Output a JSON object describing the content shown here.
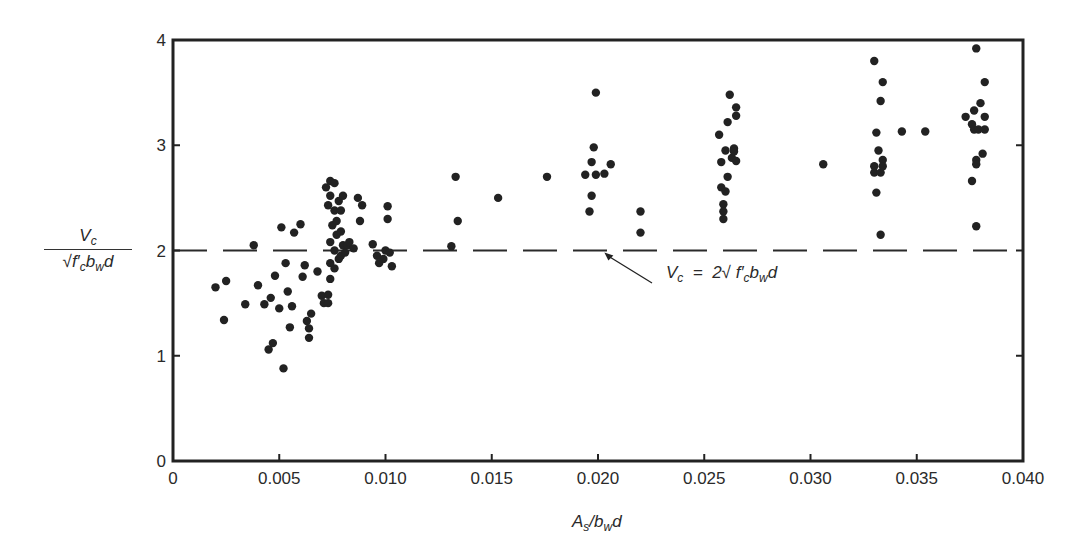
{
  "chart_data": {
    "type": "scatter",
    "title": "",
    "xlabel": "As/bwd",
    "ylabel": "Vc / (sqrt(f'c) bw d)",
    "xlim": [
      0,
      0.04
    ],
    "ylim": [
      0,
      4
    ],
    "x_ticks": [
      "0",
      "0.005",
      "0.010",
      "0.015",
      "0.020",
      "0.025",
      "0.030",
      "0.035",
      "0.040"
    ],
    "y_ticks": [
      "0",
      "1",
      "2",
      "3",
      "4"
    ],
    "grid": false,
    "legend": null,
    "reference_line": {
      "y": 2.0,
      "style": "dashed",
      "label": "Vc = 2 sqrt(f'c) bw d"
    },
    "annotation": {
      "text": "Vc = 2√f′c bw d",
      "arrow_to": [
        0.0203,
        2.0
      ]
    },
    "series": [
      {
        "name": "test data",
        "points": [
          [
            0.002,
            1.65
          ],
          [
            0.0025,
            1.71
          ],
          [
            0.0024,
            1.34
          ],
          [
            0.0034,
            1.49
          ],
          [
            0.0038,
            2.05
          ],
          [
            0.004,
            1.67
          ],
          [
            0.0043,
            1.49
          ],
          [
            0.0045,
            1.06
          ],
          [
            0.0046,
            1.55
          ],
          [
            0.0047,
            1.12
          ],
          [
            0.0048,
            1.76
          ],
          [
            0.005,
            1.45
          ],
          [
            0.0051,
            2.22
          ],
          [
            0.0052,
            0.88
          ],
          [
            0.0053,
            1.88
          ],
          [
            0.0054,
            1.61
          ],
          [
            0.0055,
            1.27
          ],
          [
            0.0056,
            1.47
          ],
          [
            0.0057,
            2.17
          ],
          [
            0.006,
            2.25
          ],
          [
            0.0061,
            1.75
          ],
          [
            0.0062,
            1.86
          ],
          [
            0.0063,
            1.33
          ],
          [
            0.0064,
            1.26
          ],
          [
            0.0064,
            1.17
          ],
          [
            0.0065,
            1.4
          ],
          [
            0.0068,
            1.8
          ],
          [
            0.007,
            1.57
          ],
          [
            0.0071,
            1.5
          ],
          [
            0.0073,
            1.5
          ],
          [
            0.0073,
            1.58
          ],
          [
            0.0074,
            1.73
          ],
          [
            0.0072,
            2.6
          ],
          [
            0.0074,
            2.66
          ],
          [
            0.0076,
            2.64
          ],
          [
            0.0073,
            2.43
          ],
          [
            0.0074,
            2.52
          ],
          [
            0.0076,
            2.38
          ],
          [
            0.0078,
            2.47
          ],
          [
            0.008,
            2.52
          ],
          [
            0.0079,
            2.38
          ],
          [
            0.0075,
            2.24
          ],
          [
            0.0077,
            2.15
          ],
          [
            0.0074,
            2.08
          ],
          [
            0.0076,
            2.0
          ],
          [
            0.0078,
            1.92
          ],
          [
            0.008,
            2.05
          ],
          [
            0.0082,
            2.05
          ],
          [
            0.0074,
            1.88
          ],
          [
            0.0076,
            1.83
          ],
          [
            0.0079,
            1.95
          ],
          [
            0.0081,
            1.98
          ],
          [
            0.0077,
            2.28
          ],
          [
            0.0079,
            2.18
          ],
          [
            0.0083,
            2.08
          ],
          [
            0.0085,
            2.02
          ],
          [
            0.0087,
            2.5
          ],
          [
            0.0089,
            2.43
          ],
          [
            0.0088,
            2.28
          ],
          [
            0.0094,
            2.06
          ],
          [
            0.0096,
            1.95
          ],
          [
            0.0097,
            1.88
          ],
          [
            0.0099,
            1.92
          ],
          [
            0.01,
            2.0
          ],
          [
            0.0101,
            2.42
          ],
          [
            0.0101,
            2.3
          ],
          [
            0.0102,
            1.98
          ],
          [
            0.0103,
            1.85
          ],
          [
            0.0131,
            2.04
          ],
          [
            0.0133,
            2.7
          ],
          [
            0.0134,
            2.28
          ],
          [
            0.0153,
            2.5
          ],
          [
            0.0176,
            2.7
          ],
          [
            0.0194,
            2.72
          ],
          [
            0.0196,
            2.37
          ],
          [
            0.0197,
            2.52
          ],
          [
            0.0197,
            2.84
          ],
          [
            0.0198,
            2.98
          ],
          [
            0.0199,
            3.5
          ],
          [
            0.0199,
            2.72
          ],
          [
            0.0203,
            2.73
          ],
          [
            0.0206,
            2.82
          ],
          [
            0.022,
            2.37
          ],
          [
            0.022,
            2.17
          ],
          [
            0.0257,
            3.1
          ],
          [
            0.0258,
            2.84
          ],
          [
            0.0258,
            2.6
          ],
          [
            0.0259,
            2.3
          ],
          [
            0.0259,
            2.44
          ],
          [
            0.0259,
            2.37
          ],
          [
            0.026,
            2.95
          ],
          [
            0.026,
            2.56
          ],
          [
            0.0261,
            3.22
          ],
          [
            0.0261,
            2.7
          ],
          [
            0.0262,
            3.48
          ],
          [
            0.0263,
            2.88
          ],
          [
            0.0264,
            2.97
          ],
          [
            0.0264,
            2.94
          ],
          [
            0.0265,
            3.36
          ],
          [
            0.0265,
            3.28
          ],
          [
            0.0265,
            2.85
          ],
          [
            0.0306,
            2.82
          ],
          [
            0.033,
            3.8
          ],
          [
            0.033,
            2.74
          ],
          [
            0.033,
            2.8
          ],
          [
            0.0331,
            2.55
          ],
          [
            0.0331,
            3.12
          ],
          [
            0.0332,
            2.95
          ],
          [
            0.0333,
            3.42
          ],
          [
            0.0333,
            2.74
          ],
          [
            0.0334,
            2.86
          ],
          [
            0.0334,
            3.6
          ],
          [
            0.0334,
            2.8
          ],
          [
            0.0333,
            2.15
          ],
          [
            0.0343,
            3.13
          ],
          [
            0.0354,
            3.13
          ],
          [
            0.0373,
            3.27
          ],
          [
            0.0376,
            3.2
          ],
          [
            0.0376,
            2.66
          ],
          [
            0.0377,
            3.33
          ],
          [
            0.0377,
            3.15
          ],
          [
            0.0378,
            2.86
          ],
          [
            0.0378,
            3.92
          ],
          [
            0.0378,
            2.23
          ],
          [
            0.0379,
            3.15
          ],
          [
            0.038,
            3.4
          ],
          [
            0.0381,
            2.92
          ],
          [
            0.0382,
            3.6
          ],
          [
            0.0382,
            3.27
          ],
          [
            0.0382,
            3.15
          ],
          [
            0.0378,
            2.82
          ]
        ]
      }
    ]
  },
  "labels": {
    "y_axis_numerator": "V",
    "y_axis_numerator_sub": "c",
    "y_axis_denominator": "√f′",
    "y_axis_denominator_sub1": "c",
    "y_axis_denominator_mid": "b",
    "y_axis_denominator_sub2": "w",
    "y_axis_denominator_end": "d",
    "x_axis_main": "A",
    "x_axis_sub1": "s",
    "x_axis_mid": "/b",
    "x_axis_sub2": "w",
    "x_axis_end": "d",
    "annot_v": "V",
    "annot_c": "c",
    "annot_eq": "  =  2√ f′",
    "annot_c2": "c",
    "annot_b": "b",
    "annot_w": "w",
    "annot_d": "d"
  },
  "colors": {
    "axis": "#222222",
    "points": "#222222",
    "reference_line": "#2a2a2a"
  }
}
